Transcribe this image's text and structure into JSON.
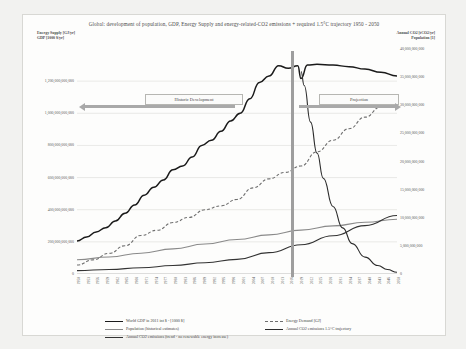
{
  "chart_data": {
    "type": "line",
    "title": "Global: development of population, GDP, Energy Supply and energy-related-CO2 emissions + required 1.5°C trajectory 1950 - 2050",
    "xlabel": "",
    "ylabel_left": "Energy Supply [GJ/yr]\nGDP [1000 $/yr]",
    "ylabel_right": "Annual CO2 [tCO2/yr]\nPopulation [1]",
    "grid": true,
    "legend_position": "bottom",
    "xlim": [
      1950,
      2050
    ],
    "ylim_left": [
      0,
      1400000000000
    ],
    "ylim_right": [
      0,
      40000000000
    ],
    "yticks_left": [
      "1,200,000,000,000",
      "1,000,000,000,000",
      "800,000,000,000",
      "600,000,000,000",
      "400,000,000,000",
      "200,000,000,000",
      "0"
    ],
    "yticks_right": [
      "40,000,000,000",
      "35,000,000,000",
      "30,000,000,000",
      "25,000,000,000",
      "20,000,000,000",
      "15,000,000,000",
      "10,000,000,000",
      "5,000,000,000",
      "0"
    ],
    "xticks": [
      "1950",
      "1953",
      "1956",
      "1959",
      "1962",
      "1965",
      "1968",
      "1971",
      "1974",
      "1977",
      "1980",
      "1983",
      "1986",
      "1989",
      "1992",
      "1995",
      "1998",
      "2001",
      "2004",
      "2007",
      "2010",
      "2013",
      "2016",
      "2019",
      "2022",
      "2025",
      "2028",
      "2031",
      "2034",
      "2037",
      "2040",
      "2043",
      "2046",
      "2050"
    ],
    "annotations": [
      {
        "name": "historic-development",
        "text": "Historic Development"
      },
      {
        "name": "projection",
        "text": "Projection"
      },
      {
        "name": "divider-year",
        "text": "2020"
      }
    ],
    "series": [
      {
        "name": "World GDP in 2011 int $ - [1000 $]",
        "color": "#1a1a1a",
        "style": "solid",
        "axis": "left",
        "x": [
          1950,
          1953,
          1956,
          1959,
          1962,
          1965,
          1968,
          1971,
          1974,
          1977,
          1980,
          1983,
          1986,
          1989,
          1992,
          1995,
          1998,
          2001,
          2004,
          2007,
          2010,
          2013,
          2016,
          2019,
          2020,
          2022,
          2025,
          2030,
          2035,
          2040,
          2045,
          2050
        ],
        "values": [
          205000000000,
          230000000000,
          262000000000,
          288000000000,
          330000000000,
          378000000000,
          430000000000,
          490000000000,
          540000000000,
          585000000000,
          648000000000,
          672000000000,
          728000000000,
          800000000000,
          832000000000,
          888000000000,
          952000000000,
          1000000000000,
          1090000000000,
          1192000000000,
          1232000000000,
          1296000000000,
          1280000000000,
          1296000000000,
          1216000000000,
          1300000000000,
          1305000000000,
          1300000000000,
          1290000000000,
          1275000000000,
          1255000000000,
          1232000000000
        ]
      },
      {
        "name": "Energy Demand [GJ]",
        "color": "#6e6e6e",
        "style": "dashed",
        "axis": "left",
        "x": [
          1950,
          1955,
          1960,
          1965,
          1970,
          1975,
          1980,
          1985,
          1990,
          1995,
          2000,
          2005,
          2010,
          2015,
          2020,
          2025,
          2030,
          2035,
          2040,
          2045,
          2050
        ],
        "values": [
          56000000000,
          88000000000,
          128000000000,
          176000000000,
          240000000000,
          272000000000,
          320000000000,
          352000000000,
          400000000000,
          424000000000,
          464000000000,
          536000000000,
          592000000000,
          632000000000,
          672000000000,
          760000000000,
          832000000000,
          904000000000,
          976000000000,
          1040000000000,
          1112000000000
        ]
      },
      {
        "name": "Population (historical estimates)",
        "color": "#8a8a8a",
        "style": "solid",
        "axis": "right",
        "x": [
          1950,
          1960,
          1970,
          1980,
          1990,
          2000,
          2010,
          2020,
          2030,
          2040,
          2050
        ],
        "values": [
          2536000000,
          3034000000,
          3700000000,
          4458000000,
          5327000000,
          6143000000,
          6957000000,
          7795000000,
          8548000000,
          9199000000,
          9735000000
        ]
      },
      {
        "name": "Annual CO2 emissions 1.5°C trajectory",
        "color": "#2b2b2b",
        "style": "solid",
        "axis": "right",
        "x": [
          2020,
          2021,
          2023,
          2025,
          2027,
          2030,
          2033,
          2036,
          2040,
          2044,
          2047,
          2050
        ],
        "values": [
          36000000000,
          33500000000,
          27000000000,
          21500000000,
          17000000000,
          12000000000,
          8200000000,
          5400000000,
          3000000000,
          1500000000,
          800000000,
          300000000
        ]
      },
      {
        "name": "Annual CO2 emissions (trend - no renewable energy increase)",
        "color": "#333333",
        "style": "solid",
        "axis": "right",
        "x": [
          1950,
          1960,
          1970,
          1980,
          1990,
          2000,
          2010,
          2020,
          2030,
          2040,
          2050
        ],
        "values": [
          600000000,
          800000000,
          1100000000,
          1500000000,
          2000000000,
          2600000000,
          3800000000,
          5200000000,
          6800000000,
          8600000000,
          10400000000
        ]
      }
    ]
  },
  "legend": {
    "items": [
      {
        "label": "World GDP in 2011 int $ - [1000 $]",
        "color": "#1a1a1a",
        "style": "solid"
      },
      {
        "label": "Energy Demand [GJ]",
        "color": "#6e6e6e",
        "style": "dashed"
      },
      {
        "label": "Population (historical estimates)",
        "color": "#8a8a8a",
        "style": "solid"
      },
      {
        "label": "Annual CO2 emissions 1.5°C trajectory",
        "color": "#2b2b2b",
        "style": "solid"
      },
      {
        "label": "Annual CO2 emissions (trend - no renewable energy increase)",
        "color": "#333333",
        "style": "solid"
      }
    ]
  }
}
